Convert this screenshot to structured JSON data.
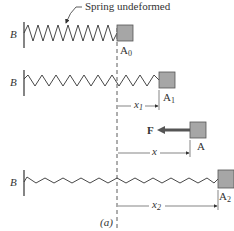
{
  "diagram": {
    "annotation": "Spring undeformed",
    "caption": "(a)",
    "colors": {
      "block_fill": "#a6a6a6",
      "block_stroke": "#555555",
      "line": "#333333",
      "force_arrow": "#555555"
    },
    "rows": [
      {
        "wall_label": "B",
        "block_label": "A",
        "block_sub": "0"
      },
      {
        "wall_label": "B",
        "block_label": "A",
        "block_sub": "1",
        "dimension": {
          "label": "x",
          "sub": "1"
        }
      },
      {
        "force_label": "F",
        "block_label": "A",
        "block_sub": "",
        "dimension": {
          "label": "x",
          "sub": ""
        }
      },
      {
        "wall_label": "B",
        "block_label": "A",
        "block_sub": "2",
        "dimension": {
          "label": "x",
          "sub": "2"
        }
      }
    ]
  }
}
